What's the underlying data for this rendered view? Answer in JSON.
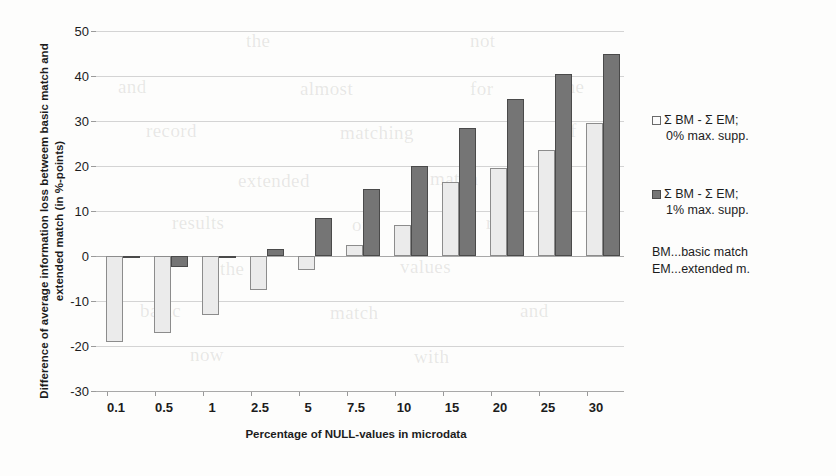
{
  "chart_data": {
    "type": "bar",
    "title": "",
    "xlabel": "Percentage of NULL-values in microdata",
    "ylabel": "Difference of average information loss betweem basic match and extended match (in %-points)",
    "categories": [
      "0.1",
      "0.5",
      "1",
      "2.5",
      "5",
      "7.5",
      "10",
      "15",
      "20",
      "25",
      "30"
    ],
    "series": [
      {
        "name": "Σ BM - Σ EM; 0% max. supp.",
        "color": "#ebebeb",
        "values": [
          -19,
          -17,
          -13,
          -7.5,
          -3,
          2.5,
          7,
          16.5,
          19.5,
          23.5,
          29.5
        ]
      },
      {
        "name": "Σ BM - Σ EM; 1% max. supp.",
        "color": "#757575",
        "values": [
          -0.5,
          -2.5,
          -0.5,
          1.5,
          8.5,
          15,
          20,
          28.5,
          35,
          40.5,
          45
        ]
      }
    ],
    "ylim": [
      -30,
      50
    ],
    "yticks": [
      50,
      40,
      30,
      20,
      10,
      0,
      -10,
      -20,
      -30
    ],
    "ytick_labels": [
      "50",
      "40",
      "30",
      "20",
      "10",
      "0",
      "-10",
      "-20",
      "-30"
    ],
    "grid": true,
    "legend_position": "right"
  },
  "legend": {
    "entries": [
      {
        "line1": "Σ BM - Σ EM;",
        "line2": "0% max. supp."
      },
      {
        "line1": "Σ BM - Σ EM;",
        "line2": "1% max. supp."
      }
    ],
    "notes": [
      "BM...basic match",
      "EM...extended m."
    ]
  },
  "ghost": {
    "lines": [
      {
        "text": "the",
        "x": 246,
        "y": 30
      },
      {
        "text": "not",
        "x": 470,
        "y": 30
      },
      {
        "text": "and",
        "x": 118,
        "y": 76
      },
      {
        "text": "almost",
        "x": 300,
        "y": 78
      },
      {
        "text": "for",
        "x": 470,
        "y": 78
      },
      {
        "text": "the",
        "x": 560,
        "y": 76
      },
      {
        "text": "record",
        "x": 146,
        "y": 120
      },
      {
        "text": "matching",
        "x": 340,
        "y": 122
      },
      {
        "text": "of",
        "x": 560,
        "y": 120
      },
      {
        "text": "extended",
        "x": 238,
        "y": 170
      },
      {
        "text": "match",
        "x": 430,
        "y": 168
      },
      {
        "text": "results",
        "x": 172,
        "y": 212
      },
      {
        "text": "of",
        "x": 352,
        "y": 214
      },
      {
        "text": "rows",
        "x": 486,
        "y": 212
      },
      {
        "text": "the",
        "x": 220,
        "y": 258
      },
      {
        "text": "values",
        "x": 400,
        "y": 256
      },
      {
        "text": "basic",
        "x": 140,
        "y": 300
      },
      {
        "text": "match",
        "x": 330,
        "y": 302
      },
      {
        "text": "and",
        "x": 520,
        "y": 300
      },
      {
        "text": "now",
        "x": 190,
        "y": 344
      },
      {
        "text": "with",
        "x": 414,
        "y": 346
      }
    ]
  }
}
